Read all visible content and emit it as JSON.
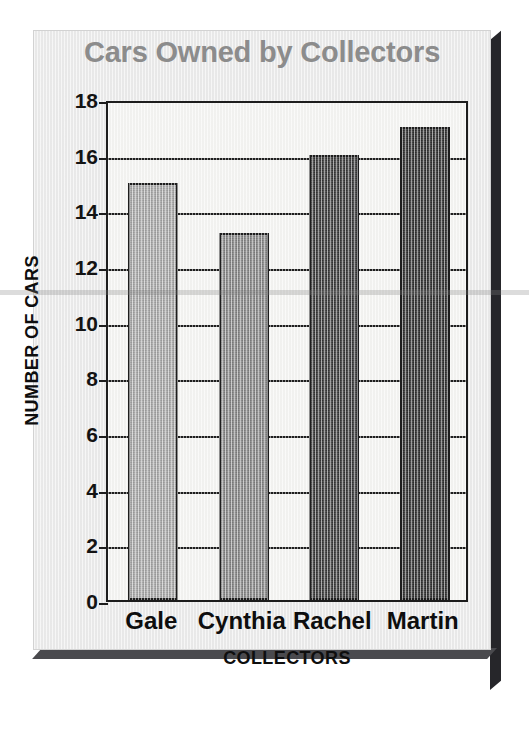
{
  "chart_data": {
    "type": "bar",
    "title": "Cars Owned by Collectors",
    "xlabel": "COLLECTORS",
    "ylabel": "NUMBER OF CARS",
    "categories": [
      "Gale",
      "Cynthia",
      "Rachel",
      "Martin"
    ],
    "values": [
      15,
      13.2,
      16,
      17
    ],
    "ylim": [
      0,
      18
    ],
    "yticks": [
      0,
      2,
      4,
      6,
      8,
      10,
      12,
      14,
      16,
      18
    ],
    "ytick_labels": [
      "0",
      "2",
      "4",
      "6",
      "8",
      "10",
      "12",
      "14",
      "16",
      "18"
    ],
    "grid": true,
    "grid_axis": "y",
    "legend": false,
    "bar_colors": [
      "#a9a9a9",
      "#878787",
      "#3a3a3a",
      "#303030"
    ],
    "bar_edge_color": "#1d1d1d",
    "plot_background": "#f4f4f2",
    "panel_background": "#ebebeb",
    "title_color": "#8c8c8c",
    "axis_text_color": "#0e0e0e"
  },
  "figure": {
    "title": "Cars Owned by Collectors",
    "xaxis_title": "COLLECTORS",
    "yaxis_title": "NUMBER OF CARS"
  }
}
